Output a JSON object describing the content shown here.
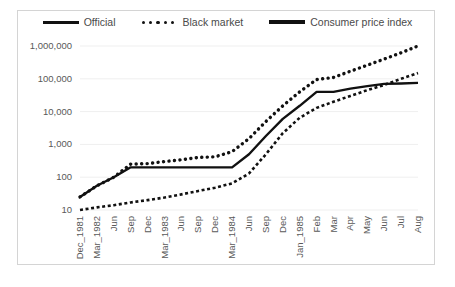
{
  "chart_data": {
    "type": "line",
    "title": "",
    "xlabel": "",
    "ylabel": "",
    "log_scale": true,
    "ylim": [
      10,
      1000000
    ],
    "ytick_labels": [
      "1,000,000",
      "100,000",
      "10,000",
      "1,000",
      "100",
      "10"
    ],
    "ytick_values": [
      1000000,
      100000,
      10000,
      1000,
      100,
      10
    ],
    "grid": true,
    "legend_position": "top",
    "categories": [
      "Dec_1981",
      "Mar_1982",
      "Jun",
      "Sep",
      "Dec",
      "Mar_1983",
      "Jun",
      "Sep",
      "Dec",
      "Mar_1984",
      "Jun",
      "Sep",
      "Dec",
      "Jan_1985",
      "Feb",
      "Mar",
      "Apr",
      "May",
      "Jun",
      "Jul",
      "Aug"
    ],
    "series": [
      {
        "name": "Official",
        "style": "solid",
        "color": "#111111",
        "values": [
          25,
          55,
          100,
          200,
          200,
          200,
          200,
          200,
          200,
          200,
          500,
          1800,
          6000,
          15000,
          40000,
          40000,
          50000,
          60000,
          70000,
          72000,
          75000
        ]
      },
      {
        "name": "Black market",
        "style": "dotted",
        "color": "#111111",
        "values": [
          25,
          55,
          100,
          250,
          260,
          300,
          340,
          400,
          420,
          600,
          1500,
          5000,
          15000,
          40000,
          95000,
          110000,
          170000,
          260000,
          400000,
          620000,
          1000000
        ]
      },
      {
        "name": "Consumer price index",
        "style": "dashed",
        "color": "#111111",
        "values": [
          10,
          12,
          14,
          17,
          20,
          24,
          30,
          38,
          48,
          65,
          130,
          500,
          2200,
          6500,
          13000,
          20000,
          30000,
          45000,
          65000,
          100000,
          150000
        ]
      }
    ]
  },
  "legend": {
    "items": [
      {
        "label": "Official",
        "marker": "solid-line"
      },
      {
        "label": "Black market",
        "marker": "dotted-line"
      },
      {
        "label": "Consumer price index",
        "marker": "thick-solid-line"
      }
    ]
  },
  "colors": {
    "series": "#111111",
    "grid": "#efefef",
    "frame_border": "#d4d4d4",
    "tick_text": "#595959",
    "background": "#ffffff"
  }
}
